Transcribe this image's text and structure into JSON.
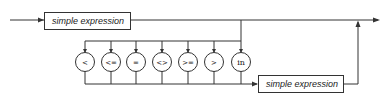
{
  "diagram": {
    "type": "syntax-diagram",
    "nodes": {
      "first_box": {
        "label": "simple expression"
      },
      "second_box": {
        "label": "simple expression"
      }
    },
    "operators": [
      {
        "label": "<"
      },
      {
        "label": "<="
      },
      {
        "label": "="
      },
      {
        "label": "<>"
      },
      {
        "label": ">="
      },
      {
        "label": ">"
      },
      {
        "label": "in"
      }
    ],
    "colors": {
      "stroke": "#333333",
      "background": "#ffffff",
      "text": "#222222"
    }
  }
}
